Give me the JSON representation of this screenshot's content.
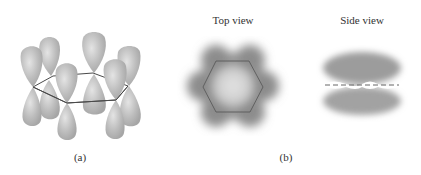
{
  "figure": {
    "panel_a": {
      "caption": "(a)",
      "description": "Benzene p orbitals: six dumbbell-shaped p orbitals perpendicular to a hexagonal carbon ring",
      "ring_vertices": [
        [
          33,
          87
        ],
        [
          53,
          76
        ],
        [
          93,
          73
        ],
        [
          128,
          86
        ],
        [
          116,
          100
        ],
        [
          67,
          103
        ]
      ],
      "orbital_count": 6
    },
    "panel_b": {
      "caption": "(b)",
      "top_view": {
        "title": "Top view",
        "shape": "hexagon with delocalized electron cloud"
      },
      "side_view": {
        "title": "Side view",
        "shape": "electron clouds above and below plane (dashed line)"
      }
    },
    "colors": {
      "lobe_fill": "#b9b9b9",
      "lobe_highlight": "#e2e2e2",
      "ring_line": "#4a4a4a",
      "cloud_dark": "#7c7c7c",
      "cloud_light": "#dadada"
    }
  }
}
